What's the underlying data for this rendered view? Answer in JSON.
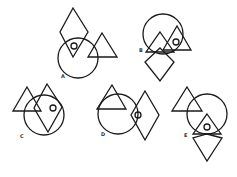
{
  "colors": {
    "stroke": "#1a1a1a",
    "background": "#ffffff",
    "label": "#333333"
  },
  "options": [
    {
      "label": "A",
      "label_pos": [
        61,
        78
      ]
    },
    {
      "label": "B",
      "label_pos": [
        139,
        52
      ]
    },
    {
      "label": "C",
      "label_pos": [
        20,
        138
      ]
    },
    {
      "label": "D",
      "label_pos": [
        101,
        136
      ]
    },
    {
      "label": "E",
      "label_pos": [
        184,
        137
      ]
    }
  ]
}
